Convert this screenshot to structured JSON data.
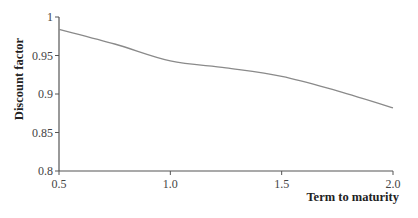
{
  "chart_data": {
    "type": "line",
    "title": "",
    "xlabel": "Term to maturity",
    "ylabel": "Discount factor",
    "xlim": [
      0.5,
      2.0
    ],
    "ylim": [
      0.8,
      1.0
    ],
    "grid": false,
    "legend": null,
    "x_ticks": [
      "0.5",
      "1.0",
      "1.5",
      "2.0"
    ],
    "y_ticks": [
      "0.8",
      "0.85",
      "0.9",
      "0.95",
      "1"
    ],
    "series": [
      {
        "name": "Discount factor",
        "color": "#8a8a8a",
        "x": [
          0.5,
          0.75,
          1.0,
          1.25,
          1.5,
          1.75,
          2.0
        ],
        "values": [
          0.984,
          0.965,
          0.943,
          0.934,
          0.923,
          0.904,
          0.882
        ]
      }
    ]
  },
  "axes": {
    "x_label": "Term to maturity",
    "y_label": "Discount factor",
    "x_tick_labels": [
      "0.5",
      "1.0",
      "1.5",
      "2.0"
    ],
    "y_tick_labels": [
      "0.8",
      "0.85",
      "0.9",
      "0.95",
      "1"
    ]
  }
}
